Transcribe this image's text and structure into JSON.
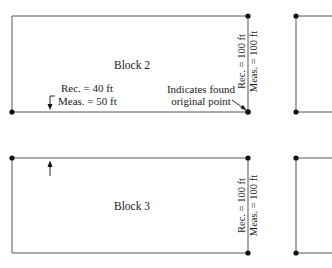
{
  "blocks": [
    {
      "name": "Block 2",
      "recorded_measured_side": {
        "rec": "Rec. = 40 ft",
        "meas": "Meas. = 50 ft"
      },
      "right_side": {
        "rec": "Rec. = 100 ft",
        "meas": "Meas. = 100 ft"
      },
      "annotation": {
        "line1": "Indicates found",
        "line2": "original point"
      }
    },
    {
      "name": "Block 3",
      "right_side": {
        "rec": "Rec. = 100 ft",
        "meas": "Meas. = 100 ft"
      }
    }
  ],
  "colors": {
    "line": "#555555",
    "dot": "#111111",
    "text": "#1a1a1a",
    "background": "#ffffff"
  }
}
